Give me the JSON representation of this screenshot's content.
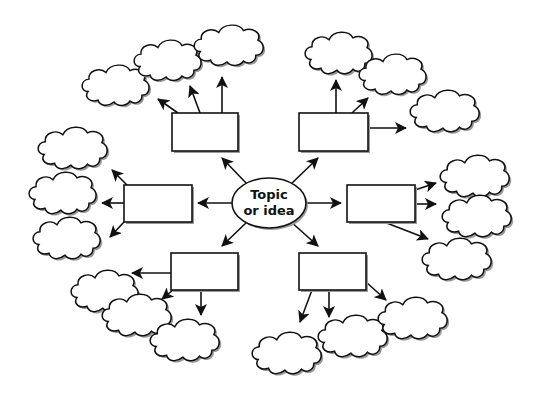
{
  "diagram": {
    "type": "mind-map / cluster web",
    "center": {
      "line1": "Topic",
      "line2": "or idea",
      "shape": "ellipse"
    },
    "colors": {
      "stroke": "#111111",
      "fill": "#ffffff",
      "shadow": "#9a9a9a"
    },
    "branches": [
      {
        "id": "top-left",
        "box": "empty",
        "cloud_count": 3
      },
      {
        "id": "top-right",
        "box": "empty",
        "cloud_count": 3
      },
      {
        "id": "left",
        "box": "empty",
        "cloud_count": 3
      },
      {
        "id": "right",
        "box": "empty",
        "cloud_count": 3
      },
      {
        "id": "bottom-left",
        "box": "empty",
        "cloud_count": 3
      },
      {
        "id": "bottom-right",
        "box": "empty",
        "cloud_count": 3
      }
    ]
  }
}
